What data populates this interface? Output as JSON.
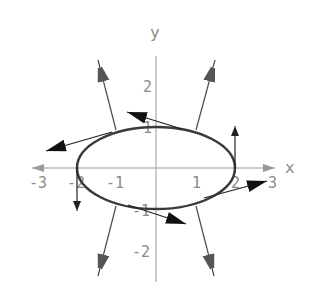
{
  "figure": {
    "axes": {
      "x_label": "x",
      "y_label": "y",
      "x_ticks": [
        {
          "value": -3,
          "label": "-3"
        },
        {
          "value": -2,
          "label": "-2"
        },
        {
          "value": -1,
          "label": "-1"
        },
        {
          "value": 1,
          "label": "1"
        },
        {
          "value": 2,
          "label": "2"
        },
        {
          "value": 3,
          "label": "3"
        }
      ],
      "y_ticks": [
        {
          "value": 2,
          "label": "2"
        },
        {
          "value": 1,
          "label": "1"
        },
        {
          "value": -1,
          "label": "-1"
        },
        {
          "value": -2,
          "label": "-2"
        }
      ]
    },
    "curve": {
      "type": "ellipse",
      "equation": "x^2/4 + y^2 = 1",
      "semi_axis_x": 2,
      "semi_axis_y": 1
    },
    "vectors": {
      "normal_vectors": [
        {
          "id": "upper-left-normal",
          "from": [
            -1,
            0.87
          ],
          "direction": "outward-up-left"
        },
        {
          "id": "upper-right-normal",
          "from": [
            1,
            0.87
          ],
          "direction": "outward-up-right"
        },
        {
          "id": "lower-left-normal",
          "from": [
            -1,
            -0.87
          ],
          "direction": "outward-down-left"
        },
        {
          "id": "lower-right-normal",
          "from": [
            1,
            -0.87
          ],
          "direction": "outward-down-right"
        }
      ],
      "tangent_vectors": [
        {
          "id": "top-tangent",
          "from": [
            0.6,
            0.95
          ],
          "direction": "left"
        },
        {
          "id": "left-tangent",
          "from": [
            -1.2,
            0.8
          ],
          "direction": "left-down"
        },
        {
          "id": "bottom-tangent",
          "from": [
            -0.65,
            -0.95
          ],
          "direction": "right-down"
        },
        {
          "id": "right-tangent",
          "from": [
            1.25,
            -0.75
          ],
          "direction": "right-up"
        },
        {
          "id": "right-vertex-tangent",
          "from": [
            2,
            0
          ],
          "direction": "up"
        },
        {
          "id": "left-vertex-tangent",
          "from": [
            -2,
            0
          ],
          "direction": "down"
        }
      ]
    }
  }
}
